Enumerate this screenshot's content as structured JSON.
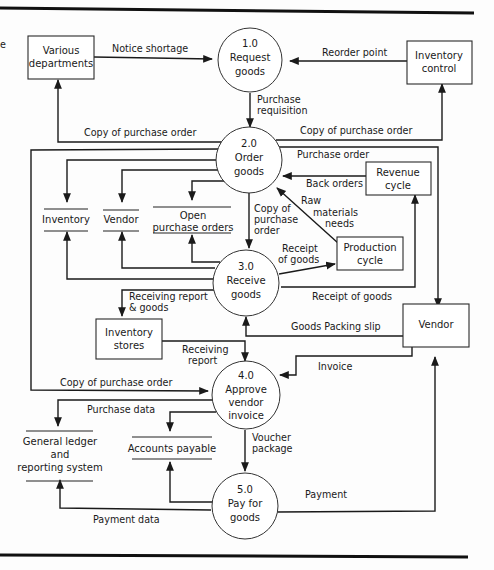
{
  "diagram": {
    "type": "data-flow-diagram",
    "processes": [
      {
        "id": "1.0",
        "number": "1.0",
        "line1": "Request",
        "line2": "goods"
      },
      {
        "id": "2.0",
        "number": "2.0",
        "line1": "Order",
        "line2": "goods"
      },
      {
        "id": "3.0",
        "number": "3.0",
        "line1": "Receive",
        "line2": "goods"
      },
      {
        "id": "4.0",
        "number": "4.0",
        "line1": "Approve",
        "line2": "vendor",
        "line3": "invoice"
      },
      {
        "id": "5.0",
        "number": "5.0",
        "line1": "Pay for",
        "line2": "goods"
      }
    ],
    "entities": {
      "various_departments": {
        "line1": "Various",
        "line2": "departments"
      },
      "inventory_control": {
        "line1": "Inventory",
        "line2": "control"
      },
      "revenue_cycle": {
        "line1": "Revenue",
        "line2": "cycle"
      },
      "production_cycle": {
        "line1": "Production",
        "line2": "cycle"
      },
      "vendor": {
        "line1": "Vendor"
      },
      "inventory_stores": {
        "line1": "Inventory",
        "line2": "stores"
      }
    },
    "stores": {
      "inventory": {
        "line1": "Inventory"
      },
      "vendor": {
        "line1": "Vendor"
      },
      "open_po": {
        "line1": "Open",
        "line2": "purchase orders"
      },
      "general_ledger": {
        "line1": "General ledger",
        "line2": "and",
        "line3": "reporting system"
      },
      "accounts_payable": {
        "line1": "Accounts payable"
      }
    },
    "flows": {
      "notice_shortage": "Notice shortage",
      "reorder_point": "Reorder point",
      "purchase_requisition_1": "Purchase",
      "purchase_requisition_2": "requisition",
      "copy_po_left": "Copy of purchase order",
      "copy_po_right": "Copy of purchase order",
      "purchase_order": "Purchase order",
      "back_orders": "Back orders",
      "raw_materials_1": "Raw",
      "raw_materials_2": "materials",
      "raw_materials_3": "needs",
      "copy_po_down_1": "Copy of",
      "copy_po_down_2": "purchase",
      "copy_po_down_3": "order",
      "receipt_goods_prod_1": "Receipt",
      "receipt_goods_prod_2": "of goods",
      "receipt_goods_rev": "Receipt of goods",
      "receiving_report_goods_1": "Receiving report",
      "receiving_report_goods_2": "& goods",
      "goods_packing_slip": "Goods Packing slip",
      "receiving_report_1": "Receiving",
      "receiving_report_2": "report",
      "invoice": "Invoice",
      "copy_po_4": "Copy of purchase order",
      "purchase_data": "Purchase data",
      "voucher_package_1": "Voucher",
      "voucher_package_2": "package",
      "payment": "Payment",
      "payment_data": "Payment data"
    },
    "margin_fragment": "e"
  }
}
